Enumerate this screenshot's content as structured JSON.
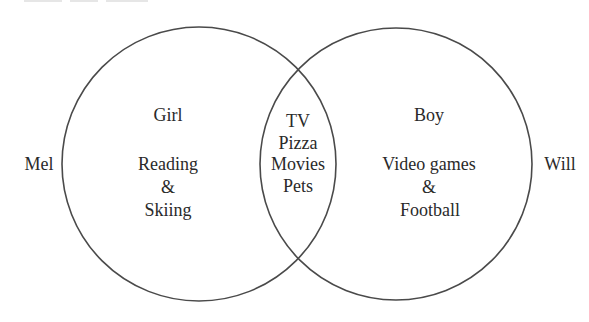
{
  "diagram": {
    "type": "venn",
    "stroke_color": "#4a4a4a",
    "text_color": "#2a2a2a",
    "left_set": {
      "outside_label": "Mel",
      "title": "Girl",
      "items": [
        "Reading",
        "&",
        "Skiing"
      ]
    },
    "right_set": {
      "outside_label": "Will",
      "title": "Boy",
      "items": [
        "Video games",
        "&",
        "Football"
      ]
    },
    "intersection": {
      "items": [
        "TV",
        "Pizza",
        "Movies",
        "Pets"
      ]
    }
  }
}
